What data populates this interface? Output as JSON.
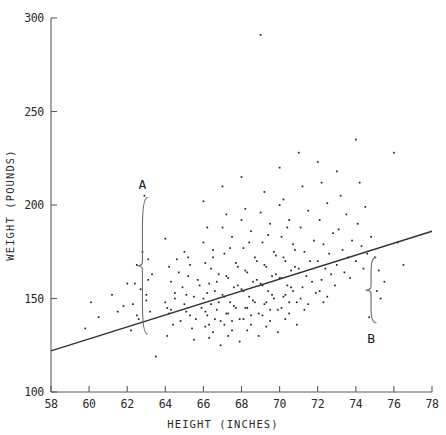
{
  "chart_data": {
    "type": "scatter",
    "title": "",
    "xlabel": "HEIGHT (INCHES)",
    "ylabel": "WEIGHT (POUNDS)",
    "xlim": [
      58,
      78
    ],
    "ylim": [
      100,
      300
    ],
    "xticks": [
      58,
      60,
      62,
      64,
      66,
      68,
      70,
      72,
      74,
      76,
      78
    ],
    "yticks": [
      100,
      150,
      200,
      250,
      300
    ],
    "xtick_labels": [
      "58",
      "60",
      "62",
      "64",
      "66",
      "68",
      "70",
      "72",
      "74",
      "76",
      "78"
    ],
    "ytick_labels": [
      "100",
      "150",
      "200",
      "250",
      "300"
    ],
    "grid": false,
    "legend": false,
    "marker": "dot",
    "series": [
      {
        "name": "observations",
        "x": [
          62.9,
          63.1,
          62.5,
          63.0,
          62.3,
          63.2,
          62.6,
          62.4,
          63.3,
          62.8,
          62.2,
          63.0,
          62.7,
          62.5,
          63.1,
          64.0,
          64.2,
          64.5,
          64.1,
          64.8,
          64.3,
          64.6,
          64.0,
          64.4,
          64.7,
          64.2,
          64.9,
          64.1,
          64.5,
          64.3,
          65.0,
          65.2,
          65.5,
          65.1,
          65.8,
          65.3,
          65.6,
          65.0,
          65.4,
          65.7,
          65.2,
          65.9,
          65.1,
          65.5,
          65.3,
          66.0,
          66.2,
          66.5,
          66.1,
          66.8,
          66.3,
          66.6,
          66.0,
          66.4,
          66.7,
          66.2,
          66.9,
          66.1,
          66.5,
          66.3,
          66.0,
          66.4,
          66.7,
          66.2,
          66.8,
          66.1,
          66.6,
          66.3,
          66.5,
          66.9,
          67.0,
          67.2,
          67.5,
          67.1,
          67.8,
          67.3,
          67.6,
          67.0,
          67.4,
          67.7,
          67.2,
          67.9,
          67.1,
          67.5,
          67.3,
          67.0,
          67.4,
          67.7,
          67.2,
          67.8,
          67.1,
          67.6,
          67.3,
          67.5,
          67.9,
          68.0,
          68.2,
          68.5,
          68.1,
          68.8,
          68.3,
          68.6,
          68.0,
          68.4,
          68.7,
          68.2,
          68.9,
          68.1,
          68.5,
          68.3,
          68.0,
          68.4,
          68.7,
          68.2,
          68.8,
          68.1,
          68.6,
          68.3,
          68.5,
          68.9,
          69.0,
          69.2,
          69.5,
          69.1,
          69.8,
          69.3,
          69.6,
          69.0,
          69.4,
          69.7,
          69.2,
          69.9,
          69.1,
          69.5,
          69.3,
          69.0,
          69.4,
          69.7,
          69.2,
          69.8,
          69.1,
          69.6,
          69.3,
          69.5,
          69.9,
          70.0,
          70.2,
          70.5,
          70.1,
          70.8,
          70.3,
          70.6,
          70.0,
          70.4,
          70.7,
          70.2,
          70.9,
          70.1,
          70.5,
          70.3,
          70.0,
          70.4,
          70.7,
          70.2,
          70.8,
          70.1,
          70.6,
          70.3,
          70.5,
          70.9,
          71.0,
          71.2,
          71.5,
          71.1,
          71.8,
          71.3,
          71.6,
          71.0,
          71.4,
          71.7,
          71.2,
          71.9,
          71.1,
          71.5,
          71.3,
          72.0,
          72.2,
          72.5,
          72.1,
          72.8,
          72.3,
          72.6,
          72.0,
          72.4,
          72.7,
          72.2,
          72.9,
          72.1,
          72.5,
          72.3,
          73.0,
          73.2,
          73.5,
          73.1,
          73.8,
          73.3,
          73.6,
          73.0,
          73.4,
          73.7,
          74.0,
          74.2,
          74.5,
          74.1,
          74.8,
          74.3,
          74.6,
          74.0,
          74.4,
          74.7,
          75.0,
          75.2,
          75.5,
          75.1,
          75.3,
          76.0,
          76.2,
          76.5,
          60.5,
          61.2,
          61.8,
          62.0,
          63.5,
          59.8,
          60.1,
          61.5
        ],
        "y": [
          205,
          171,
          168,
          152,
          147,
          143,
          139,
          158,
          163,
          175,
          133,
          149,
          155,
          141,
          160,
          182,
          167,
          153,
          145,
          138,
          159,
          171,
          148,
          136,
          164,
          142,
          156,
          130,
          150,
          144,
          175,
          162,
          151,
          143,
          157,
          168,
          139,
          147,
          134,
          160,
          172,
          145,
          152,
          128,
          141,
          202,
          188,
          176,
          169,
          163,
          158,
          154,
          150,
          147,
          144,
          141,
          138,
          135,
          132,
          129,
          180,
          166,
          159,
          153,
          148,
          143,
          139,
          136,
          172,
          125,
          210,
          195,
          183,
          174,
          167,
          161,
          156,
          152,
          148,
          145,
          142,
          139,
          136,
          133,
          130,
          188,
          177,
          169,
          162,
          157,
          151,
          146,
          142,
          138,
          127,
          215,
          198,
          186,
          177,
          170,
          164,
          159,
          155,
          151,
          148,
          145,
          142,
          139,
          136,
          133,
          192,
          180,
          172,
          165,
          160,
          154,
          149,
          145,
          141,
          130,
          291,
          207,
          190,
          180,
          173,
          167,
          162,
          158,
          154,
          150,
          147,
          144,
          141,
          138,
          135,
          196,
          184,
          175,
          168,
          163,
          157,
          152,
          148,
          144,
          132,
          220,
          203,
          192,
          183,
          176,
          170,
          165,
          161,
          157,
          154,
          151,
          148,
          145,
          142,
          139,
          200,
          188,
          179,
          172,
          167,
          161,
          156,
          152,
          148,
          136,
          228,
          210,
          197,
          188,
          181,
          175,
          170,
          166,
          162,
          159,
          156,
          153,
          150,
          147,
          144,
          223,
          212,
          201,
          192,
          185,
          179,
          174,
          170,
          166,
          163,
          160,
          157,
          154,
          151,
          148,
          218,
          205,
          195,
          187,
          181,
          176,
          172,
          168,
          164,
          161,
          235,
          212,
          199,
          190,
          183,
          178,
          174,
          170,
          166,
          140,
          172,
          165,
          159,
          154,
          150,
          228,
          180,
          168,
          140,
          152,
          146,
          158,
          119,
          134,
          148,
          143
        ]
      }
    ],
    "fit_line": {
      "name": "least-squares regression line",
      "x_start": 58,
      "y_start": 122,
      "x_end": 78,
      "y_end": 186
    },
    "annotations": [
      {
        "label": "A",
        "x": 62.8,
        "y_top": 204,
        "y_bottom": 131,
        "label_x": 62.8,
        "label_y": 211,
        "description": "brace marking positive residual span above fitted line"
      },
      {
        "label": "B",
        "x": 74.8,
        "y_top": 172,
        "y_bottom": 137,
        "label_x": 74.8,
        "label_y": 129,
        "description": "brace marking negative residual span below fitted line"
      }
    ]
  }
}
